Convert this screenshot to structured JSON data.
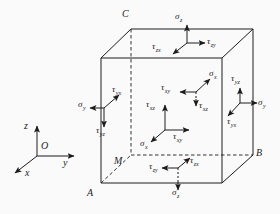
{
  "diagram": {
    "type": "stress-element-cube",
    "colors": {
      "line": "#1c1c1c",
      "background": "#fafafa"
    },
    "corners": {
      "A": "A",
      "B": "B",
      "C": "C",
      "M": "M"
    },
    "axes": {
      "origin_label": "O",
      "x_label": "x",
      "y_label": "y",
      "z_label": "z"
    },
    "stresses": {
      "top_face": {
        "sigma_z": {
          "base": "σ",
          "sub": "z"
        },
        "tau_zy": {
          "base": "τ",
          "sub": "zy"
        },
        "tau_zx": {
          "base": "τ",
          "sub": "zx"
        }
      },
      "left_face": {
        "sigma_y": {
          "base": "σ",
          "sub": "y"
        },
        "tau_yx": {
          "base": "τ",
          "sub": "yx"
        },
        "tau_yz": {
          "base": "τ",
          "sub": "yz"
        }
      },
      "back_face": {
        "sigma_x": {
          "base": "σ",
          "sub": "x"
        },
        "tau_xy": {
          "base": "τ",
          "sub": "xy"
        },
        "tau_xz": {
          "base": "τ",
          "sub": "xz"
        }
      },
      "front_face": {
        "sigma_x": {
          "base": "σ",
          "sub": "x"
        },
        "tau_xy": {
          "base": "τ",
          "sub": "xy"
        },
        "tau_xz": {
          "base": "τ",
          "sub": "xz"
        }
      },
      "right_face": {
        "sigma_y": {
          "base": "σ",
          "sub": "y"
        },
        "tau_yx": {
          "base": "τ",
          "sub": "yx"
        },
        "tau_yz": {
          "base": "τ",
          "sub": "yz"
        }
      },
      "bottom_face": {
        "sigma_z": {
          "base": "σ",
          "sub": "z"
        },
        "tau_zy": {
          "base": "τ",
          "sub": "zy"
        },
        "tau_zx": {
          "base": "τ",
          "sub": "zx"
        }
      }
    }
  }
}
